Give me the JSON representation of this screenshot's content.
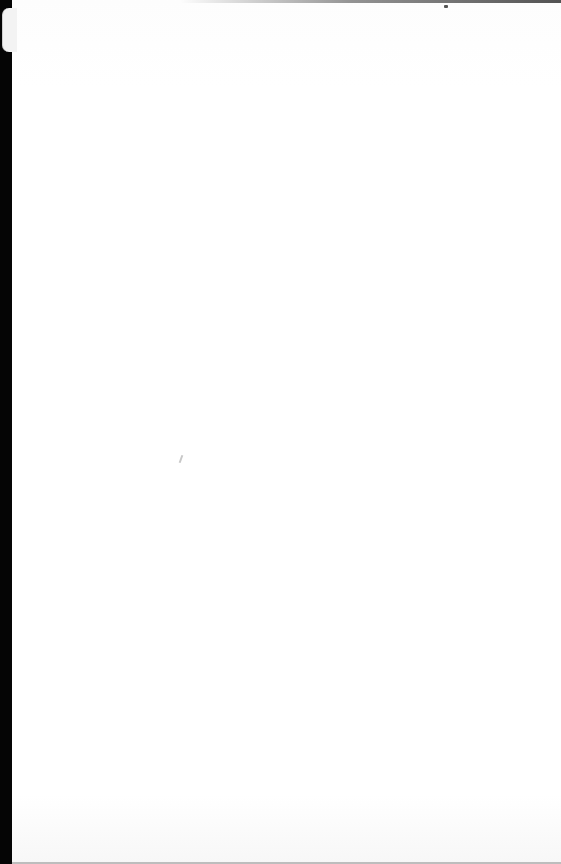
{
  "document": {
    "type": "scanned-page",
    "content": "",
    "state": "blank page with faint show-through from reverse side"
  },
  "colors": {
    "page": "#ffffff",
    "binding": "#050505"
  }
}
